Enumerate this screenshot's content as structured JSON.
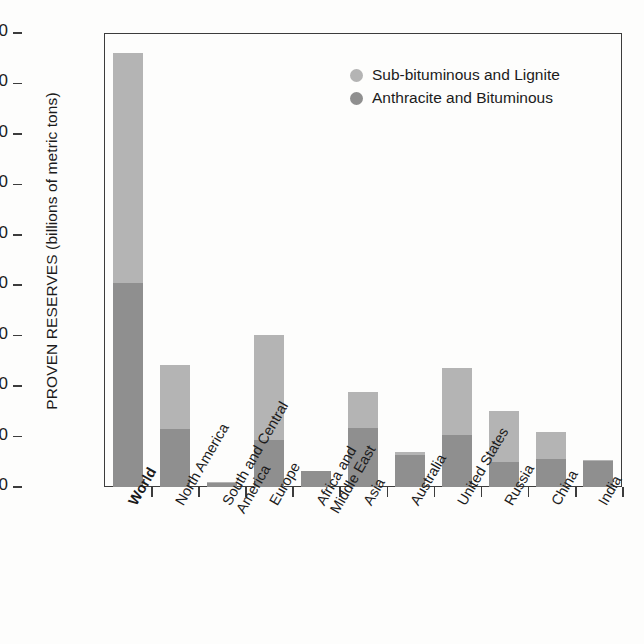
{
  "chart_data": {
    "type": "bar",
    "title": "",
    "subtitle": "",
    "xlabel": "",
    "ylabel": "PROVEN RESERVES (billions of metric tons)",
    "ylim": [
      0,
      900
    ],
    "ytick_step": 100,
    "yticks": [
      "900",
      "800",
      "700",
      "600",
      "500",
      "400",
      "300",
      "200",
      "100",
      "0"
    ],
    "grid": false,
    "stacked": true,
    "legend_position": "top-right",
    "categories": [
      "World",
      "North America",
      "South and Central America",
      "Europe",
      "Africa and Middle East",
      "Asia",
      "Australia",
      "United States",
      "Russia",
      "China",
      "India"
    ],
    "category_display": [
      "World",
      "North America",
      "South and Central\nAmerica",
      "Europe",
      "Africa and\nMiddle East",
      "Asia",
      "Australia",
      "United States",
      "Russia",
      "China",
      "India"
    ],
    "category_bold": [
      true,
      false,
      false,
      false,
      false,
      false,
      false,
      false,
      false,
      false,
      false
    ],
    "series": [
      {
        "name": "Anthracite and Bituminous",
        "color": "#8f8f8f",
        "values": [
          404,
          115,
          7,
          93,
          31,
          117,
          63,
          103,
          49,
          56,
          52
        ]
      },
      {
        "name": "Sub-bituminous and Lignite",
        "color": "#b4b4b4",
        "values": [
          456,
          127,
          3,
          209,
          1,
          71,
          7,
          133,
          101,
          54,
          2
        ]
      }
    ],
    "totals": [
      860,
      242,
      10,
      302,
      32,
      188,
      70,
      236,
      150,
      110,
      54
    ]
  },
  "legend": {
    "items": [
      {
        "label": "Sub-bituminous and Lignite",
        "color": "#b4b4b4",
        "marker": "circle-icon"
      },
      {
        "label": "Anthracite and Bituminous",
        "color": "#8f8f8f",
        "marker": "circle-icon"
      }
    ]
  },
  "colors": {
    "light_segment": "#b4b4b4",
    "dark_segment": "#8f8f8f",
    "axis": "#3c3c3c",
    "text": "#1b1b1b",
    "background": "#fdfdfc"
  }
}
